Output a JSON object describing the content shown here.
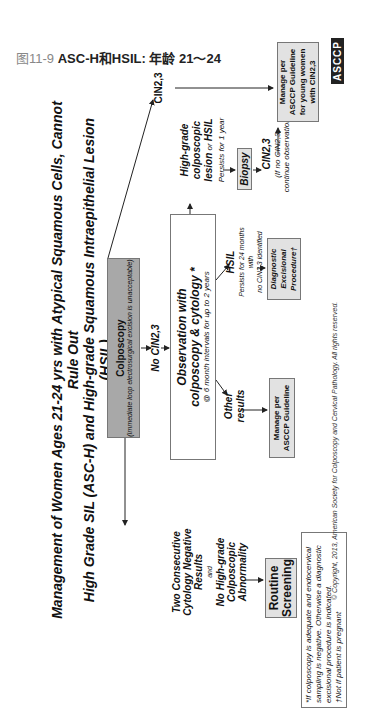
{
  "caption": {
    "number": "图11-9",
    "text": "ASC-H和HSIL: 年龄 21～24"
  },
  "title": {
    "line1": "Management of Women Ages 21-24 yrs with Atypical Squamous Cells, Cannot Rule Out",
    "line2": "High Grade SIL (ASC-H) and High-grade Squamous Intraepithelial Lesion (HSIL)"
  },
  "nodes": {
    "colposcopy": {
      "title": "Colposcopy",
      "note": "(Immediate loop electrosurgical excision is unacceptable)"
    },
    "cin23_top": "CIN2,3",
    "no_cin23": "No CIN2,3",
    "observation": {
      "line1": "Observation with",
      "line2": "colposcopy & cytology *",
      "line3": "@ 6 month intervals for up to 2 years"
    },
    "high_grade": {
      "line1": "High-grade colposcopic",
      "line2a": "lesion",
      "line2b": " or ",
      "line2c": "HSIL",
      "line3": "Persists for 1 year"
    },
    "biopsy": "Biopsy",
    "cin23_bottom": {
      "title": "CIN2,3",
      "note1": "(If no CIN2,3,",
      "note2": "continue observation)"
    },
    "manage_young": {
      "line1": "Manage per",
      "line2": "ASCCP Guideline",
      "line3": "for young women",
      "line4": "with CIN2,3"
    },
    "hsil": {
      "title": "HSIL",
      "note1": "Persists for 24 months with",
      "note2": "no CIN2,3 identified"
    },
    "diagnostic": {
      "line1": "Diagnostic",
      "line2": "Excisional",
      "line3": "Procedure†"
    },
    "other_results": {
      "line1": "Other",
      "line2": "results"
    },
    "manage_asccp": {
      "line1": "Manage per",
      "line2": "ASCCP Guideline"
    },
    "two_consecutive": {
      "line1": "Two Consecutive",
      "line2": "Cytology Negative",
      "line3": "Results",
      "and": "and",
      "line4": "No High-grade",
      "line5": "Colposcopic",
      "line6": "Abnormality"
    },
    "routine": {
      "line1": "Routine",
      "line2": "Screening"
    }
  },
  "footnote": {
    "line1": "*If colposcopy is adequate and endocervical",
    "line2": "sampling is negative. Otherwise a diagnostic",
    "line3": "excisional procedure is indicated.",
    "line4": "†Not if patient is pregnant"
  },
  "copyright": "© Copyright, 2013, American Society for Colposcopy and Cervical Pathology. All rights reserved.",
  "logo": "ASCCP",
  "colors": {
    "gray_box": "#a8a8a8",
    "light_box": "#e2e2e2",
    "line": "#222222"
  }
}
